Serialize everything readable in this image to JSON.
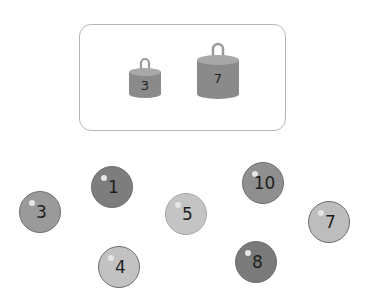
{
  "scale_box": {
    "weights": [
      {
        "label": "3",
        "icon": "weight-icon"
      },
      {
        "label": "7",
        "icon": "weight-icon"
      }
    ]
  },
  "balls": [
    {
      "label": "3",
      "color": "#9a9a9a"
    },
    {
      "label": "1",
      "color": "#7d7d7d"
    },
    {
      "label": "4",
      "color": "#c2c2c2"
    },
    {
      "label": "5",
      "color": "#c4c4c4"
    },
    {
      "label": "10",
      "color": "#8f8f8f"
    },
    {
      "label": "8",
      "color": "#7a7a7a"
    },
    {
      "label": "7",
      "color": "#bdbdbd"
    }
  ],
  "colors": {
    "weight_body": "#8a8a8a",
    "weight_top": "#a8a8a8",
    "box_border": "#b5b5b5"
  }
}
